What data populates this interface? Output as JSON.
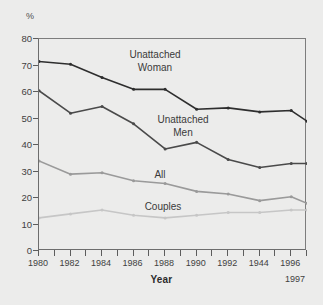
{
  "chart_data": {
    "type": "line",
    "title": "",
    "xlabel": "Year",
    "ylabel": "%",
    "unit_marker": "%",
    "xlim": [
      1980,
      1997
    ],
    "ylim": [
      0,
      80
    ],
    "yticks": [
      0,
      10,
      20,
      30,
      40,
      50,
      60,
      70,
      80
    ],
    "grid": false,
    "legend_position": "inline-annotations",
    "x": [
      1980,
      1982,
      1984,
      1986,
      1988,
      1990,
      1992,
      1994,
      1996,
      1997
    ],
    "xtick_labels": [
      "1980",
      "1982",
      "1984",
      "1986",
      "1988",
      "1990",
      "1992",
      "1944",
      "1996"
    ],
    "xtick_values": [
      1980,
      1982,
      1984,
      1986,
      1988,
      1990,
      1992,
      1994,
      1996
    ],
    "minor_xtick_values": [
      1981,
      1983,
      1985,
      1987,
      1989,
      1991,
      1993,
      1995,
      1997
    ],
    "end_tick_label": "1997",
    "series": [
      {
        "name": "Unattached Woman",
        "color": "#2e2e2e",
        "annotation_lines": [
          "Unattached",
          "Woman"
        ],
        "values": [
          71.5,
          70.5,
          65.5,
          61.0,
          61.0,
          53.5,
          54.0,
          52.5,
          53.0,
          49.0
        ]
      },
      {
        "name": "Unattached Men",
        "color": "#4a4a4a",
        "annotation_lines": [
          "Unattached",
          "Men"
        ],
        "values": [
          60.5,
          52.0,
          54.5,
          48.0,
          38.5,
          41.0,
          34.5,
          31.5,
          33.0,
          33.0
        ]
      },
      {
        "name": "All",
        "color": "#9a9a9a",
        "annotation_lines": [
          "All"
        ],
        "values": [
          34.0,
          29.0,
          29.5,
          26.5,
          25.5,
          22.5,
          21.5,
          19.0,
          20.5,
          18.0
        ]
      },
      {
        "name": "Couples",
        "color": "#c6c6c6",
        "annotation_lines": [
          "Couples"
        ],
        "values": [
          12.5,
          14.0,
          15.5,
          13.5,
          12.5,
          13.5,
          14.5,
          14.5,
          15.5,
          15.5
        ]
      }
    ]
  },
  "annotations": {
    "woman_line1": "Unattached",
    "woman_line2": "Woman",
    "men_line1": "Unattached",
    "men_line2": "Men",
    "all": "All",
    "couples": "Couples"
  },
  "axis": {
    "unit": "%",
    "x_title": "Year",
    "end_label": "1997"
  }
}
